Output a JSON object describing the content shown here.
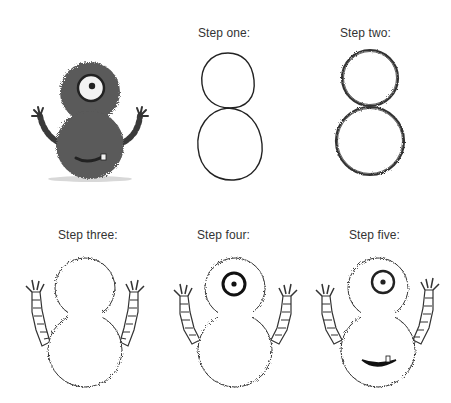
{
  "colors": {
    "background": "#ffffff",
    "label_text": "#333333",
    "line": "#222222",
    "fur_fill": "#5a5a5a",
    "fur_dark": "#444444",
    "eye_white": "#f2f2f2"
  },
  "reference": {
    "description": "Finished grey fuzzy monster with one eye, striped arms and a toothy smile"
  },
  "steps": [
    {
      "label": "Step one:",
      "description": "Two circles stacked like a figure 8"
    },
    {
      "label": "Step two:",
      "description": "Fuzzy outline around both circles"
    },
    {
      "label": "Step three:",
      "description": "Fuzzy body with striped arms and small hands"
    },
    {
      "label": "Step four:",
      "description": "Add a single eye with pupil"
    },
    {
      "label": "Step five:",
      "description": "Add a smiling mouth with one tooth"
    }
  ]
}
